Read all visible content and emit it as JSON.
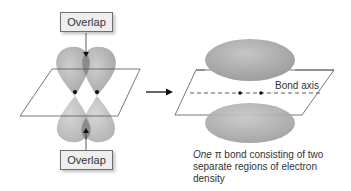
{
  "left_panel": {
    "top_label": "Overlap",
    "bottom_label": "Overlap"
  },
  "right_panel": {
    "axis_label": "Bond axis",
    "caption_emphasis": "One",
    "caption_symbol": "π",
    "caption_rest": " bond consisting of two separate regions of electron density"
  },
  "colors": {
    "lobe": "#a9a9a9",
    "overlap": "#8e8e8e",
    "plane_line": "#555555",
    "box_fill": "#eeeeee"
  }
}
